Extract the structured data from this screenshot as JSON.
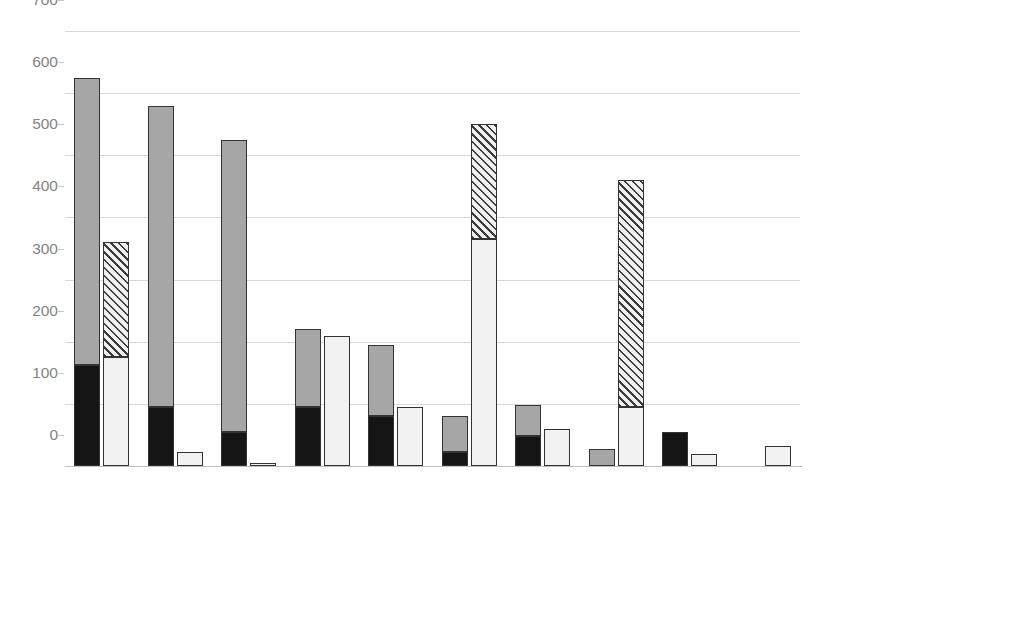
{
  "chart_data": {
    "type": "bar",
    "title": "",
    "subtitle": "",
    "xlabel": "",
    "ylabel": "",
    "ylim": [
      0,
      700
    ],
    "yticks": [
      0,
      100,
      200,
      300,
      400,
      500,
      600,
      700
    ],
    "grid": true,
    "stacked": true,
    "grouped": true,
    "legend_position": "right",
    "categories": [
      "Sustainability",
      "Regulations",
      "Legislation",
      "Economy",
      "User conflict",
      "Social benefit",
      "Environment",
      "Animal welfare",
      "Extractive resource use",
      "Culture"
    ],
    "series": [
      {
        "name": "Individual - Oppose",
        "group": "Oppose",
        "stack_order": 1,
        "color": "#151515",
        "pattern": "solid",
        "values": [
          163,
          95,
          55,
          95,
          81,
          22,
          49,
          0,
          54,
          0
        ]
      },
      {
        "name": "Template - Oppose",
        "group": "Oppose",
        "stack_order": 2,
        "color": "#a6a6a6",
        "pattern": "solid",
        "values": [
          462,
          485,
          470,
          125,
          114,
          59,
          49,
          28,
          0,
          0
        ]
      },
      {
        "name": "Individual - Support",
        "group": "Support",
        "stack_order": 1,
        "color": "#f2f2f2",
        "pattern": "solid",
        "values": [
          175,
          22,
          5,
          209,
          95,
          365,
          60,
          95,
          20,
          33
        ]
      },
      {
        "name": "Template - Support",
        "group": "Support",
        "stack_order": 2,
        "color": "#efefef",
        "pattern": "diagonal-hatch",
        "values": [
          185,
          0,
          0,
          0,
          0,
          185,
          0,
          365,
          0,
          0
        ]
      }
    ],
    "bar_totals": {
      "Oppose": [
        625,
        580,
        525,
        220,
        195,
        81,
        98,
        28,
        54,
        0
      ],
      "Support": [
        360,
        22,
        5,
        209,
        95,
        550,
        60,
        460,
        20,
        33
      ]
    }
  },
  "legend": {
    "items": [
      {
        "label": "Template - Support",
        "swatch": "hatched-square-icon",
        "color": "#efefef"
      },
      {
        "label": "Individual - Support",
        "swatch": "white-square-icon",
        "color": "#fbfbfb"
      },
      {
        "label": "Template - Oppose",
        "swatch": "gray-square-icon",
        "color": "#a6a6a6"
      },
      {
        "label": "Individual - Oppose",
        "swatch": "black-square-icon",
        "color": "#151515"
      }
    ]
  },
  "axis": {
    "y_tick_labels": [
      "700",
      "600",
      "500",
      "400",
      "300",
      "200",
      "100",
      "0"
    ],
    "x_tick_labels": [
      "Sustainability",
      "Regulations",
      "Legislation",
      "Economy",
      "User conflict",
      "Social benefit",
      "Environment",
      "Animal welfare",
      "Extractive resource use",
      "Culture"
    ]
  }
}
